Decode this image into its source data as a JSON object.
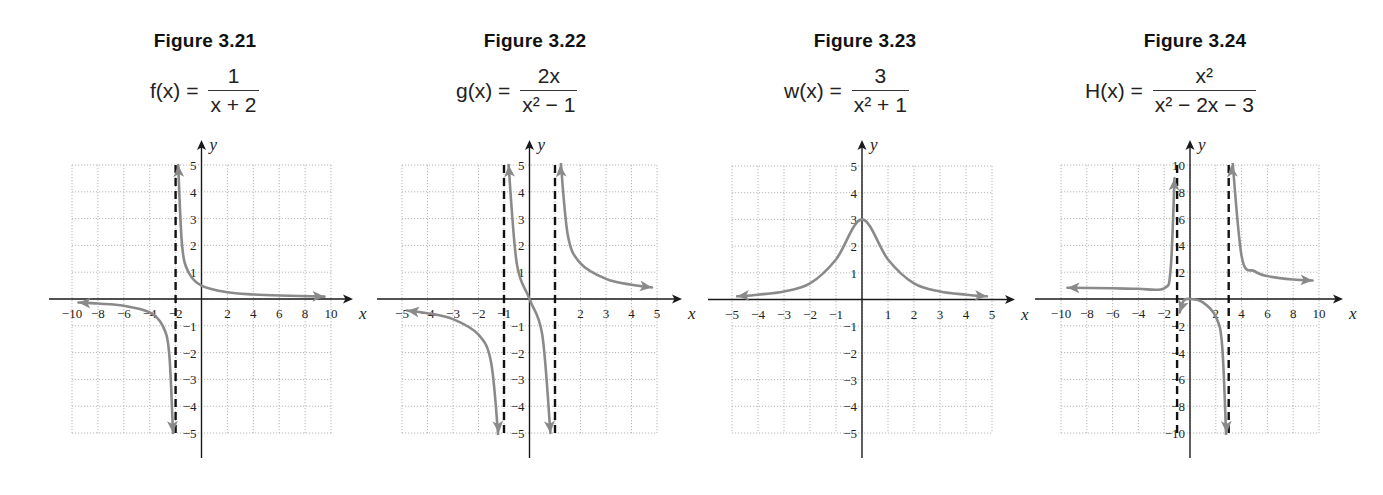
{
  "chart_data": [
    {
      "type": "line",
      "figure_label": "Figure 3.21",
      "function_name": "f(x)",
      "formula": {
        "lhs": "f(x) =",
        "numerator": "1",
        "denominator": "x + 2"
      },
      "xlabel": "x",
      "ylabel": "y",
      "xlim": [
        -10,
        10
      ],
      "ylim": [
        -5,
        5
      ],
      "x_ticks": [
        "-10",
        "-8",
        "-6",
        "-4",
        "-2",
        "2",
        "4",
        "6",
        "8",
        "10"
      ],
      "y_ticks": [
        "-5",
        "-4",
        "-3",
        "-2",
        "-1",
        "1",
        "2",
        "3",
        "4",
        "5"
      ],
      "grid": true,
      "vertical_asymptotes": [
        -2
      ],
      "series": [
        {
          "name": "left branch",
          "x": [
            -9.5,
            -8,
            -6,
            -4,
            -3,
            -2.5,
            -2.2
          ],
          "y": [
            -0.13,
            -0.17,
            -0.25,
            -0.5,
            -1,
            -2,
            -5
          ]
        },
        {
          "name": "right branch",
          "x": [
            -1.8,
            -1.5,
            -1,
            0,
            2,
            4,
            6,
            9.5
          ],
          "y": [
            5,
            2,
            1,
            0.5,
            0.25,
            0.17,
            0.13,
            0.09
          ]
        }
      ]
    },
    {
      "type": "line",
      "figure_label": "Figure 3.22",
      "function_name": "g(x)",
      "formula": {
        "lhs": "g(x) =",
        "numerator": "2x",
        "denominator": "x² − 1"
      },
      "xlabel": "x",
      "ylabel": "y",
      "xlim": [
        -5,
        5
      ],
      "ylim": [
        -5,
        5
      ],
      "x_ticks": [
        "-5",
        "-4",
        "-3",
        "-2",
        "-1",
        "2",
        "3",
        "4",
        "5"
      ],
      "y_ticks": [
        "-5",
        "-4",
        "-3",
        "-2",
        "-1",
        "1",
        "2",
        "3",
        "4",
        "5"
      ],
      "grid": true,
      "vertical_asymptotes": [
        -1,
        1
      ],
      "series": [
        {
          "name": "left branch",
          "x": [
            -4.8,
            -4,
            -3,
            -2,
            -1.5,
            -1.2
          ],
          "y": [
            -0.43,
            -0.53,
            -0.75,
            -1.33,
            -2.4,
            -5.45
          ]
        },
        {
          "name": "middle branch",
          "x": [
            -0.82,
            -0.5,
            0,
            0.5,
            0.82
          ],
          "y": [
            5,
            1.33,
            0,
            -1.33,
            -5
          ]
        },
        {
          "name": "right branch",
          "x": [
            1.2,
            1.5,
            2,
            3,
            4,
            4.8
          ],
          "y": [
            5.45,
            2.4,
            1.33,
            0.75,
            0.53,
            0.43
          ]
        }
      ]
    },
    {
      "type": "line",
      "figure_label": "Figure 3.23",
      "function_name": "w(x)",
      "formula": {
        "lhs": "w(x) =",
        "numerator": "3",
        "denominator": "x² + 1"
      },
      "xlabel": "x",
      "ylabel": "y",
      "xlim": [
        -5,
        5
      ],
      "ylim": [
        -5,
        5
      ],
      "x_ticks": [
        "-5",
        "-4",
        "-3",
        "-2",
        "-1",
        "1",
        "2",
        "3",
        "4",
        "5"
      ],
      "y_ticks": [
        "-5",
        "-4",
        "-3",
        "-2",
        "-1",
        "1",
        "2",
        "3",
        "4",
        "5"
      ],
      "grid": true,
      "vertical_asymptotes": [],
      "series": [
        {
          "name": "curve",
          "x": [
            -4.8,
            -4,
            -3,
            -2,
            -1,
            0,
            1,
            2,
            3,
            4,
            4.8
          ],
          "y": [
            0.12,
            0.18,
            0.3,
            0.6,
            1.5,
            3,
            1.5,
            0.6,
            0.3,
            0.18,
            0.12
          ]
        }
      ]
    },
    {
      "type": "line",
      "figure_label": "Figure 3.24",
      "function_name": "H(x)",
      "formula": {
        "lhs": "H(x) =",
        "numerator": "x²",
        "denominator": "x² − 2x − 3"
      },
      "xlabel": "x",
      "ylabel": "y",
      "xlim": [
        -10,
        10
      ],
      "ylim": [
        -10,
        10
      ],
      "x_ticks": [
        "-10",
        "-8",
        "-6",
        "-4",
        "-2",
        "2",
        "4",
        "6",
        "8",
        "10"
      ],
      "y_ticks": [
        "-10",
        "-8",
        "-6",
        "-4",
        "-2",
        "2",
        "4",
        "6",
        "8",
        "10"
      ],
      "grid": true,
      "vertical_asymptotes": [
        -1,
        3
      ],
      "series": [
        {
          "name": "left branch",
          "x": [
            -9.5,
            -6,
            -4,
            -2,
            -1.5,
            -1.2
          ],
          "y": [
            0.84,
            0.8,
            0.76,
            0.8,
            2.25,
            9
          ]
        },
        {
          "name": "middle branch",
          "x": [
            -0.8,
            -0.5,
            0,
            1,
            2,
            2.5,
            2.85
          ],
          "y": [
            -1,
            -0.14,
            0,
            -0.25,
            -1.33,
            -3.57,
            -13.9
          ]
        },
        {
          "name": "right branch",
          "x": [
            3.2,
            4,
            5,
            6,
            8,
            9.5
          ],
          "y": [
            12.3,
            3.2,
            2.08,
            1.71,
            1.45,
            1.38
          ]
        }
      ]
    }
  ],
  "figures": [
    {
      "title": "Figure 3.21",
      "lhs": "f(x) =",
      "num": "1",
      "den": "x + 2"
    },
    {
      "title": "Figure 3.22",
      "lhs": "g(x) =",
      "num": "2x",
      "den": "x² − 1"
    },
    {
      "title": "Figure 3.23",
      "lhs": "w(x) =",
      "num": "3",
      "den": "x² + 1"
    },
    {
      "title": "Figure 3.24",
      "lhs": "H(x) =",
      "num": "x²",
      "den": "x² − 2x − 3"
    }
  ],
  "colors": {
    "curve": "#8a8a8a",
    "axis": "#1a1a1a",
    "grid": "#b5b5b5",
    "asymptote": "#111111",
    "text": "#222222"
  }
}
